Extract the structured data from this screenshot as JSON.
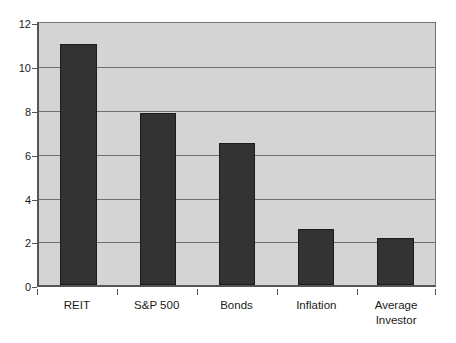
{
  "chart_data": {
    "type": "bar",
    "title": "",
    "subtitle": "",
    "xlabel": "",
    "ylabel": "",
    "categories": [
      "REIT",
      "S&P 500",
      "Bonds",
      "Inflation",
      "Average\nInvestor"
    ],
    "values": [
      11.0,
      7.85,
      6.5,
      2.55,
      2.15
    ],
    "ylim": [
      0,
      12
    ],
    "yticks": [
      0,
      2,
      4,
      6,
      8,
      10,
      12
    ],
    "ytick_labels": [
      "0",
      "2",
      "4",
      "6",
      "8",
      "10",
      "12"
    ],
    "grid": true,
    "legend": "none",
    "colors": {
      "bar_fill": "#333333",
      "bar_border": "#1c1c1c",
      "plot_background": "#d4d4d4",
      "gridline": "#6f6f6f",
      "axis": "#555555",
      "text": "#1a1a1a",
      "canvas": "#ffffff"
    }
  }
}
